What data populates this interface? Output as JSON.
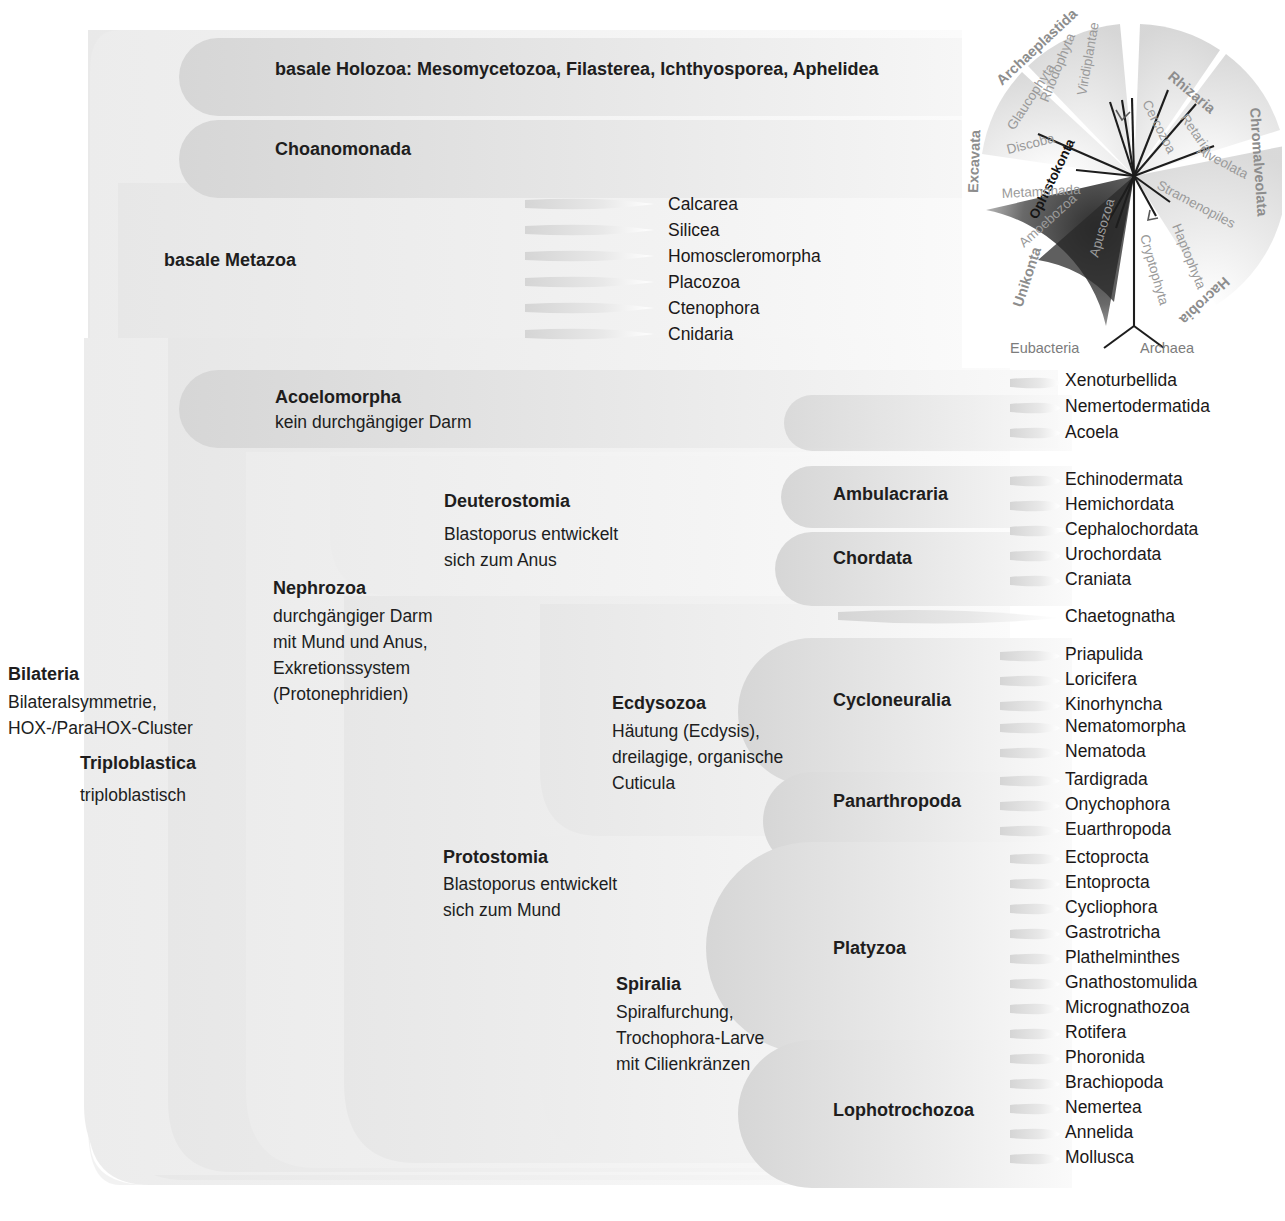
{
  "diagram": {
    "type": "cladogram",
    "language": "de"
  },
  "clades": {
    "holozoa": {
      "label": "basale Holozoa: Mesomycetozoa, Filasterea, Ichthyosporea, Aphelidea"
    },
    "choanomonada": {
      "label": "Choanomonada"
    },
    "metazoa": {
      "label": "basale Metazoa"
    },
    "acoelomorpha": {
      "label": "Acoelomorpha",
      "note": "kein durchgängiger Darm"
    },
    "deuterostomia": {
      "label": "Deuterostomia",
      "note_1": "Blastoporus entwickelt",
      "note_2": "sich zum Anus"
    },
    "ambulacraria": {
      "label": "Ambulacraria"
    },
    "chordata": {
      "label": "Chordata"
    },
    "nephrozoa": {
      "label": "Nephrozoa",
      "note_1": "durchgängiger Darm",
      "note_2": "mit Mund und Anus,",
      "note_3": "Exkretionssystem",
      "note_4": "(Protonephridien)"
    },
    "ecdysozoa": {
      "label": "Ecdysozoa",
      "note_1": "Häutung (Ecdysis),",
      "note_2": "dreilagige, organische",
      "note_3": "Cuticula"
    },
    "cycloneuralia": {
      "label": "Cycloneuralia"
    },
    "panarthropoda": {
      "label": "Panarthropoda"
    },
    "protostomia": {
      "label": "Protostomia",
      "note_1": "Blastoporus entwickelt",
      "note_2": "sich zum Mund"
    },
    "spiralia": {
      "label": "Spiralia",
      "note_1": "Spiralfurchung,",
      "note_2": "Trochophora-Larve",
      "note_3": "mit Cilienkränzen"
    },
    "platyzoa": {
      "label": "Platyzoa"
    },
    "lophotrochozoa": {
      "label": "Lophotrochozoa"
    },
    "bilateria": {
      "label": "Bilateria",
      "note_1": "Bilateralsymmetrie,",
      "note_2": "HOX-/ParaHOX-Cluster"
    },
    "triploblastica": {
      "label": "Triploblastica",
      "note_1": "triploblastisch"
    }
  },
  "leaves": {
    "metazoa": [
      "Calcarea",
      "Silicea",
      "Homoscleromorpha",
      "Placozoa",
      "Ctenophora",
      "Cnidaria"
    ],
    "acoelomorpha": [
      "Xenoturbellida",
      "Nemertodermatida",
      "Acoela"
    ],
    "ambulacraria": [
      "Echinodermata",
      "Hemichordata"
    ],
    "chordata": [
      "Cephalochordata",
      "Urochordata",
      "Craniata"
    ],
    "ecdysozoa_basal": [
      "Chaetognatha"
    ],
    "cycloneuralia": [
      "Priapulida",
      "Loricifera",
      "Kinorhyncha",
      "Nematomorpha",
      "Nematoda"
    ],
    "panarthropoda": [
      "Tardigrada",
      "Onychophora",
      "Euarthropoda"
    ],
    "platyzoa": [
      "Ectoprocta",
      "Entoprocta",
      "Cycliophora",
      "Gastrotricha",
      "Plathelminthes",
      "Gnathostomulida",
      "Micrognathozoa",
      "Rotifera"
    ],
    "lophotrochozoa": [
      "Phoronida",
      "Brachiopoda",
      "Nemertea",
      "Annelida",
      "Mollusca"
    ]
  },
  "inset": {
    "name": "eukaryote-radial-tree",
    "supergroups": [
      "Archaeplastida",
      "Rhizaria",
      "Chromalveolata",
      "Hacrobia",
      "Unikonta",
      "Excavata"
    ],
    "highlight": "Ophistokonta",
    "taxa": [
      "Glaucophyta",
      "Rhodophyta",
      "Viridiplantae",
      "Cercozoa",
      "Retaria",
      "Alveolata",
      "Stramenopiles",
      "Haptophyta",
      "Cryptophyta",
      "Apusozoa",
      "Ophistokonta",
      "Amoebozoa",
      "Metamonada",
      "Discoba"
    ],
    "roots": [
      "Eubacteria",
      "Archaea"
    ]
  },
  "colors": {
    "text": "#201d1d",
    "blob_light": "#f2f2f2",
    "blob_mid": "#e3e3e3",
    "blob_dark": "#d2d2d2",
    "inset_gray": "#9a9a9a",
    "inset_dark": "#2b2b2b"
  }
}
